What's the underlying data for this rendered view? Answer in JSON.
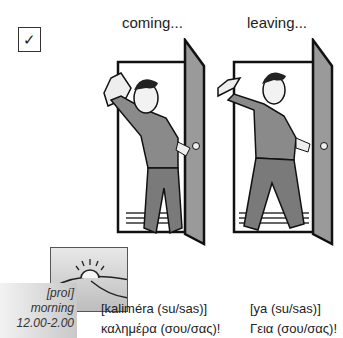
{
  "checkbox": {
    "glyph": "✓",
    "icon": "checkmark-icon"
  },
  "captions": {
    "coming": "coming...",
    "leaving": "leaving..."
  },
  "time_of_day": {
    "transliteration": "[proí]",
    "english": "morning",
    "hours": "12.00-2.00",
    "icon": "sunrise-icon"
  },
  "greetings": {
    "hello": {
      "transliteration": "[kaliméra (su/sas)]",
      "greek": "καλημέρα (σου/σας)!"
    },
    "goodbye": {
      "transliteration": "[ya (su/sas)]",
      "greek": "Γεια (σου/σας)!"
    }
  },
  "colors": {
    "shirt": "#8a8a8a",
    "door": "#9a9a9a",
    "outline": "#111111"
  }
}
